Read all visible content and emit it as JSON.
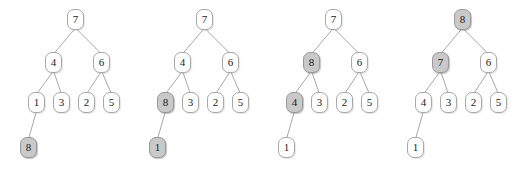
{
  "figure": {
    "highlight_color": "#c9c9c9",
    "node_fill": "#ffffff",
    "node_border": "#a8a8a8",
    "edge_color": "#9d9d9d",
    "background": "#ffffff"
  },
  "geometry": {
    "panel_width": 129,
    "panel_lefts": [
      0,
      129,
      258,
      387
    ],
    "node_width": 17,
    "node_height": 21,
    "level_y": [
      9,
      52,
      92,
      137
    ],
    "slot_x": {
      "root": 67,
      "left_child": 45,
      "right_child": 93,
      "g0": 28,
      "g1": 53,
      "g2": 78,
      "g3": 103,
      "deep": 20
    }
  },
  "panels": [
    {
      "name": "step-1",
      "nodes": [
        {
          "id": "root",
          "label": "7",
          "level": 0,
          "slot": "root",
          "highlighted": false
        },
        {
          "id": "left-child",
          "label": "4",
          "level": 1,
          "slot": "left_child",
          "highlighted": false
        },
        {
          "id": "right-child",
          "label": "6",
          "level": 1,
          "slot": "right_child",
          "highlighted": false
        },
        {
          "id": "leaf-0",
          "label": "1",
          "level": 2,
          "slot": "g0",
          "highlighted": false
        },
        {
          "id": "leaf-1",
          "label": "3",
          "level": 2,
          "slot": "g1",
          "highlighted": false
        },
        {
          "id": "leaf-2",
          "label": "2",
          "level": 2,
          "slot": "g2",
          "highlighted": false
        },
        {
          "id": "leaf-3",
          "label": "5",
          "level": 2,
          "slot": "g3",
          "highlighted": false
        },
        {
          "id": "deep-leaf",
          "label": "8",
          "level": 3,
          "slot": "deep",
          "highlighted": true
        }
      ],
      "edges": [
        {
          "from": "root",
          "to": "left-child"
        },
        {
          "from": "root",
          "to": "right-child"
        },
        {
          "from": "left-child",
          "to": "leaf-0"
        },
        {
          "from": "left-child",
          "to": "leaf-1"
        },
        {
          "from": "right-child",
          "to": "leaf-2"
        },
        {
          "from": "right-child",
          "to": "leaf-3"
        },
        {
          "from": "leaf-0",
          "to": "deep-leaf"
        }
      ]
    },
    {
      "name": "step-2",
      "nodes": [
        {
          "id": "root",
          "label": "7",
          "level": 0,
          "slot": "root",
          "highlighted": false
        },
        {
          "id": "left-child",
          "label": "4",
          "level": 1,
          "slot": "left_child",
          "highlighted": false
        },
        {
          "id": "right-child",
          "label": "6",
          "level": 1,
          "slot": "right_child",
          "highlighted": false
        },
        {
          "id": "leaf-0",
          "label": "8",
          "level": 2,
          "slot": "g0",
          "highlighted": true
        },
        {
          "id": "leaf-1",
          "label": "3",
          "level": 2,
          "slot": "g1",
          "highlighted": false
        },
        {
          "id": "leaf-2",
          "label": "2",
          "level": 2,
          "slot": "g2",
          "highlighted": false
        },
        {
          "id": "leaf-3",
          "label": "5",
          "level": 2,
          "slot": "g3",
          "highlighted": false
        },
        {
          "id": "deep-leaf",
          "label": "1",
          "level": 3,
          "slot": "deep",
          "highlighted": true
        }
      ],
      "edges": [
        {
          "from": "root",
          "to": "left-child"
        },
        {
          "from": "root",
          "to": "right-child"
        },
        {
          "from": "left-child",
          "to": "leaf-0"
        },
        {
          "from": "left-child",
          "to": "leaf-1"
        },
        {
          "from": "right-child",
          "to": "leaf-2"
        },
        {
          "from": "right-child",
          "to": "leaf-3"
        },
        {
          "from": "leaf-0",
          "to": "deep-leaf"
        }
      ]
    },
    {
      "name": "step-3",
      "nodes": [
        {
          "id": "root",
          "label": "7",
          "level": 0,
          "slot": "root",
          "highlighted": false
        },
        {
          "id": "left-child",
          "label": "8",
          "level": 1,
          "slot": "left_child",
          "highlighted": true
        },
        {
          "id": "right-child",
          "label": "6",
          "level": 1,
          "slot": "right_child",
          "highlighted": false
        },
        {
          "id": "leaf-0",
          "label": "4",
          "level": 2,
          "slot": "g0",
          "highlighted": true
        },
        {
          "id": "leaf-1",
          "label": "3",
          "level": 2,
          "slot": "g1",
          "highlighted": false
        },
        {
          "id": "leaf-2",
          "label": "2",
          "level": 2,
          "slot": "g2",
          "highlighted": false
        },
        {
          "id": "leaf-3",
          "label": "5",
          "level": 2,
          "slot": "g3",
          "highlighted": false
        },
        {
          "id": "deep-leaf",
          "label": "1",
          "level": 3,
          "slot": "deep",
          "highlighted": false
        }
      ],
      "edges": [
        {
          "from": "root",
          "to": "left-child"
        },
        {
          "from": "root",
          "to": "right-child"
        },
        {
          "from": "left-child",
          "to": "leaf-0"
        },
        {
          "from": "left-child",
          "to": "leaf-1"
        },
        {
          "from": "right-child",
          "to": "leaf-2"
        },
        {
          "from": "right-child",
          "to": "leaf-3"
        },
        {
          "from": "leaf-0",
          "to": "deep-leaf"
        }
      ]
    },
    {
      "name": "step-4",
      "nodes": [
        {
          "id": "root",
          "label": "8",
          "level": 0,
          "slot": "root",
          "highlighted": true
        },
        {
          "id": "left-child",
          "label": "7",
          "level": 1,
          "slot": "left_child",
          "highlighted": true
        },
        {
          "id": "right-child",
          "label": "6",
          "level": 1,
          "slot": "right_child",
          "highlighted": false
        },
        {
          "id": "leaf-0",
          "label": "4",
          "level": 2,
          "slot": "g0",
          "highlighted": false
        },
        {
          "id": "leaf-1",
          "label": "3",
          "level": 2,
          "slot": "g1",
          "highlighted": false
        },
        {
          "id": "leaf-2",
          "label": "2",
          "level": 2,
          "slot": "g2",
          "highlighted": false
        },
        {
          "id": "leaf-3",
          "label": "5",
          "level": 2,
          "slot": "g3",
          "highlighted": false
        },
        {
          "id": "deep-leaf",
          "label": "1",
          "level": 3,
          "slot": "deep",
          "highlighted": false
        }
      ],
      "edges": [
        {
          "from": "root",
          "to": "left-child"
        },
        {
          "from": "root",
          "to": "right-child"
        },
        {
          "from": "left-child",
          "to": "leaf-0"
        },
        {
          "from": "left-child",
          "to": "leaf-1"
        },
        {
          "from": "right-child",
          "to": "leaf-2"
        },
        {
          "from": "right-child",
          "to": "leaf-3"
        },
        {
          "from": "leaf-0",
          "to": "deep-leaf"
        }
      ]
    }
  ]
}
